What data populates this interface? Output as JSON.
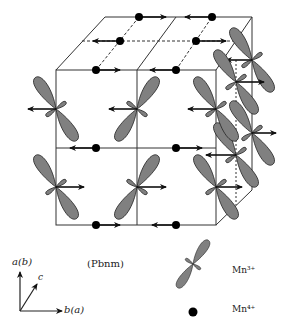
{
  "figure": {
    "space_group": "(Pbnm)",
    "axes": {
      "vertical": "a(b)",
      "horizontal": "b(a)",
      "depth": "c"
    },
    "legend": [
      {
        "symbol": "orbital-lobe",
        "label": "Mn³⁺"
      },
      {
        "symbol": "filled-dot",
        "label": "Mn⁴⁺"
      }
    ]
  },
  "colors": {
    "lobe_fill": "#808080",
    "line": "#222222",
    "dot": "#000000"
  }
}
